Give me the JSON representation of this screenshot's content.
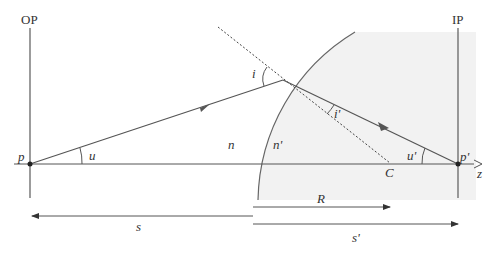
{
  "diagram": {
    "planes": {
      "object": "OP",
      "image": "IP"
    },
    "points": {
      "object": "p",
      "image": "p'",
      "center": "C"
    },
    "angles": {
      "object_ray": "u",
      "image_ray": "u'",
      "incidence": "i",
      "refraction": "i'"
    },
    "media": {
      "left": "n",
      "right": "n'"
    },
    "axis": "z",
    "distances": {
      "object": "s",
      "radius": "R",
      "image": "s'"
    },
    "colors": {
      "line": "#555555",
      "shade": "#f2f2f2"
    }
  }
}
